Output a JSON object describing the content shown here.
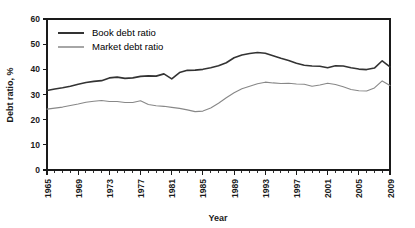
{
  "chart_data": {
    "type": "line",
    "title": "",
    "xlabel": "Year",
    "ylabel": "Debt ratio, %",
    "xlim": [
      1965,
      2009
    ],
    "ylim": [
      0,
      60
    ],
    "ytick_step": 10,
    "yticks": [
      0,
      10,
      20,
      30,
      40,
      50,
      60
    ],
    "xticks": [
      1965,
      1969,
      1973,
      1977,
      1981,
      1985,
      1989,
      1993,
      1997,
      2001,
      2005,
      2009
    ],
    "xtick_minor_step": 1,
    "grid": false,
    "legend_position": "top-left-inside",
    "x": [
      1965,
      1966,
      1967,
      1968,
      1969,
      1970,
      1971,
      1972,
      1973,
      1974,
      1975,
      1976,
      1977,
      1978,
      1979,
      1980,
      1981,
      1982,
      1983,
      1984,
      1985,
      1986,
      1987,
      1988,
      1989,
      1990,
      1991,
      1992,
      1993,
      1994,
      1995,
      1996,
      1997,
      1998,
      1999,
      2000,
      2001,
      2002,
      2003,
      2004,
      2005,
      2006,
      2007,
      2008,
      2009
    ],
    "series": [
      {
        "name": "Book debt ratio",
        "color": "#333333",
        "width": 1.6,
        "values": [
          31.6,
          32.2,
          32.7,
          33.3,
          34.1,
          34.8,
          35.2,
          35.5,
          36.6,
          36.9,
          36.4,
          36.6,
          37.2,
          37.4,
          37.3,
          38.2,
          36.2,
          38.7,
          39.6,
          39.7,
          40.0,
          40.6,
          41.4,
          42.6,
          44.6,
          45.7,
          46.3,
          46.7,
          46.4,
          45.4,
          44.4,
          43.5,
          42.4,
          41.6,
          41.3,
          41.2,
          40.6,
          41.4,
          41.3,
          40.6,
          40.1,
          39.9,
          40.5,
          43.4,
          41.0
        ]
      },
      {
        "name": "Market debt ratio",
        "color": "#888888",
        "width": 1.1,
        "values": [
          24.2,
          24.6,
          25.0,
          25.6,
          26.2,
          26.9,
          27.3,
          27.6,
          27.2,
          27.2,
          26.8,
          26.8,
          27.5,
          26.0,
          25.5,
          25.3,
          24.9,
          24.5,
          23.9,
          23.2,
          23.4,
          24.6,
          26.5,
          28.7,
          30.7,
          32.3,
          33.3,
          34.3,
          34.9,
          34.6,
          34.4,
          34.5,
          34.2,
          34.1,
          33.3,
          33.8,
          34.5,
          34.0,
          33.1,
          32.0,
          31.5,
          31.4,
          32.6,
          35.4,
          33.6
        ]
      }
    ]
  },
  "legend": {
    "items": [
      {
        "label": "Book debt ratio"
      },
      {
        "label": "Market debt ratio"
      }
    ]
  }
}
